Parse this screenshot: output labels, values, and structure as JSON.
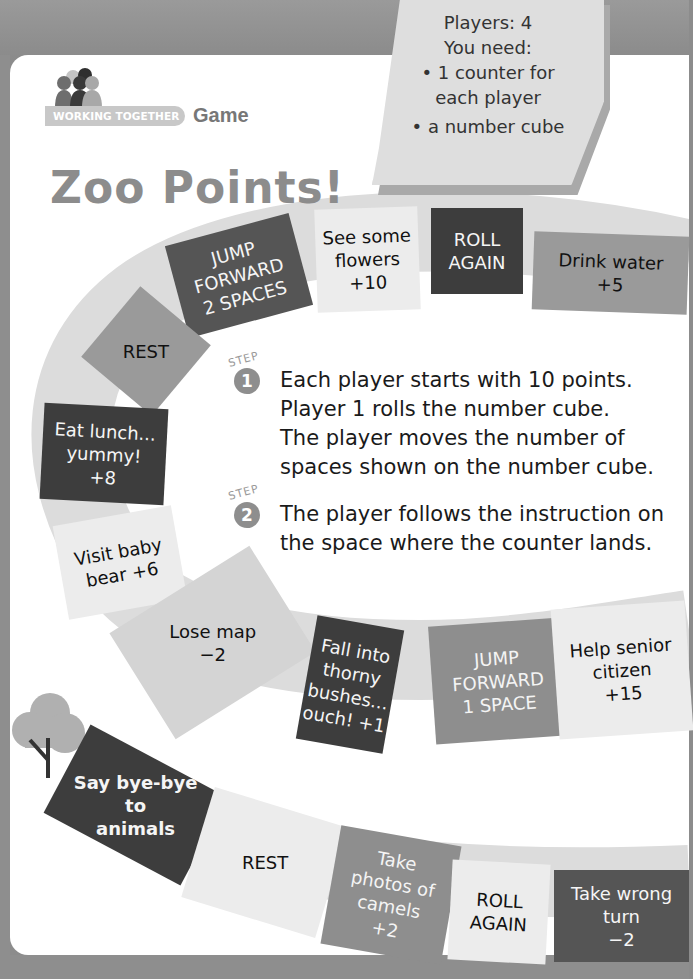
{
  "header": {
    "banner_label": "WORKING TOGETHER",
    "banner_suffix": "Game",
    "title": "Zoo Points!"
  },
  "materials_note": {
    "players_label": "Players: 4",
    "you_need_label": "You need:",
    "items": [
      "• 1 counter for",
      "each player",
      "• a number cube"
    ]
  },
  "steps": [
    {
      "label": "STEP",
      "number": "1",
      "lines": [
        "Each player starts with 10 points.",
        "Player 1 rolls the number cube.",
        "The player moves the number of",
        "spaces shown on the number cube."
      ]
    },
    {
      "label": "STEP",
      "number": "2",
      "lines": [
        "The player follows the instruction on",
        "the space where the counter lands."
      ]
    }
  ],
  "board_spaces": [
    {
      "text": "Drink water\n+5"
    },
    {
      "text": "ROLL\nAGAIN"
    },
    {
      "text": "See some\nflowers\n+10"
    },
    {
      "text": "JUMP\nFORWARD\n2 SPACES"
    },
    {
      "text": "REST"
    },
    {
      "text": "Eat lunch...\nyummy!\n+8"
    },
    {
      "text": "Visit baby\nbear +6"
    },
    {
      "text": "Lose map\n−2"
    },
    {
      "text": "Fall into\nthorny\nbushes...\nouch! +1"
    },
    {
      "text": "JUMP\nFORWARD\n1 SPACE"
    },
    {
      "text": "Help senior\ncitizen\n+15"
    },
    {
      "text": "Say bye-bye\nto\nanimals"
    },
    {
      "text": "REST"
    },
    {
      "text": "Take\nphotos of\ncamels\n+2"
    },
    {
      "text": "ROLL\nAGAIN"
    },
    {
      "text": "Take wrong\nturn\n−2"
    }
  ],
  "colors": {
    "page_bg": "#ffffff",
    "frame": "#8c8c8c",
    "path_band": "#d9d9d9",
    "dark_tile": "#3d3d3d",
    "mid_tile": "#9a9a9a",
    "light_tile": "#ececec"
  }
}
